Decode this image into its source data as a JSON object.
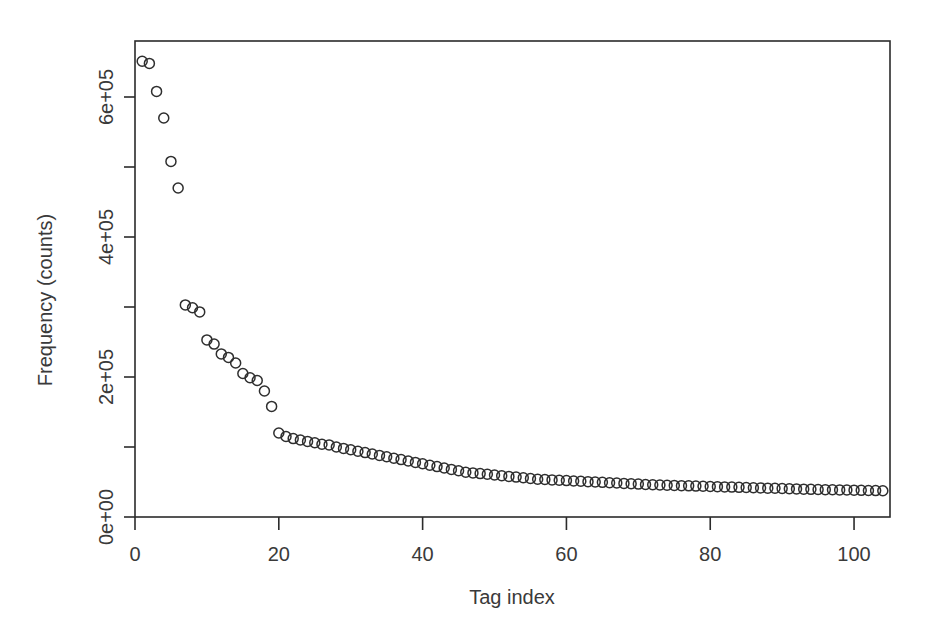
{
  "chart_data": {
    "type": "scatter",
    "title": "",
    "xlabel": "Tag index",
    "ylabel": "Frequency (counts)",
    "xlim": [
      0,
      105
    ],
    "ylim": [
      0,
      680000
    ],
    "grid": false,
    "legend": null,
    "marker": "open-circle",
    "xticks": [
      0,
      20,
      40,
      60,
      80,
      100
    ],
    "xtick_labels": [
      "0",
      "20",
      "40",
      "60",
      "80",
      "100"
    ],
    "yticks": [
      0,
      100000,
      200000,
      300000,
      400000,
      500000,
      600000
    ],
    "ytick_labels": [
      "0e+00",
      "",
      "2e+05",
      "",
      "4e+05",
      "",
      "6e+05"
    ],
    "ytick_labels_major": [
      "0e+00",
      "2e+05",
      "4e+05",
      "6e+05"
    ],
    "x": [
      1,
      2,
      3,
      4,
      5,
      6,
      7,
      8,
      9,
      10,
      11,
      12,
      13,
      14,
      15,
      16,
      17,
      18,
      19,
      20,
      21,
      22,
      23,
      24,
      25,
      26,
      27,
      28,
      29,
      30,
      31,
      32,
      33,
      34,
      35,
      36,
      37,
      38,
      39,
      40,
      41,
      42,
      43,
      44,
      45,
      46,
      47,
      48,
      49,
      50,
      51,
      52,
      53,
      54,
      55,
      56,
      57,
      58,
      59,
      60,
      61,
      62,
      63,
      64,
      65,
      66,
      67,
      68,
      69,
      70,
      71,
      72,
      73,
      74,
      75,
      76,
      77,
      78,
      79,
      80,
      81,
      82,
      83,
      84,
      85,
      86,
      87,
      88,
      89,
      90,
      91,
      92,
      93,
      94,
      95,
      96,
      97,
      98,
      99,
      100,
      101,
      102,
      103,
      104
    ],
    "y": [
      651000,
      648000,
      608000,
      570000,
      508000,
      470000,
      303000,
      299000,
      293000,
      253000,
      247000,
      233000,
      228000,
      220000,
      205000,
      199000,
      195000,
      180000,
      158000,
      120000,
      115000,
      112000,
      110000,
      108000,
      106000,
      104000,
      103000,
      100000,
      98000,
      96000,
      94000,
      92000,
      90000,
      88000,
      86000,
      84000,
      82000,
      80000,
      78000,
      76000,
      74000,
      72000,
      70000,
      68000,
      66000,
      64000,
      63000,
      62000,
      61000,
      60000,
      59000,
      58000,
      57000,
      56000,
      55000,
      54000,
      53500,
      53000,
      52500,
      52000,
      51500,
      51000,
      50500,
      50000,
      49500,
      49000,
      48500,
      48000,
      47500,
      47000,
      46500,
      46000,
      45700,
      45400,
      45100,
      44800,
      44500,
      44200,
      43900,
      43600,
      43300,
      43000,
      42700,
      42400,
      42100,
      41800,
      41500,
      41200,
      41000,
      40700,
      40400,
      40100,
      39800,
      39500,
      39300,
      39100,
      38900,
      38700,
      38500,
      38300,
      38100,
      37900,
      37700,
      37500,
      37300
    ],
    "series_name": "Tag frequency"
  },
  "axes": {
    "x_axis_title": "Tag index",
    "y_axis_title": "Frequency (counts)"
  }
}
